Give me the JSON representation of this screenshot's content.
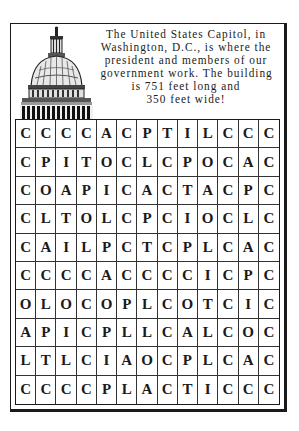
{
  "blurb": {
    "lines": [
      "The United States Capitol, in",
      "Washington, D.C., is where the",
      "president and members of our",
      "government work. The building",
      "is 751 feet long and",
      "350 feet wide!"
    ]
  },
  "illustration": {
    "icon": "capitol-dome-icon"
  },
  "puzzle": {
    "rows": [
      [
        "C",
        "C",
        "C",
        "C",
        "A",
        "C",
        "P",
        "T",
        "I",
        "L",
        "C",
        "C",
        "C"
      ],
      [
        "C",
        "P",
        "I",
        "T",
        "O",
        "C",
        "L",
        "C",
        "P",
        "O",
        "C",
        "A",
        "C"
      ],
      [
        "C",
        "O",
        "A",
        "P",
        "I",
        "C",
        "A",
        "C",
        "T",
        "A",
        "C",
        "P",
        "C"
      ],
      [
        "C",
        "L",
        "T",
        "O",
        "L",
        "C",
        "P",
        "C",
        "I",
        "O",
        "C",
        "L",
        "C"
      ],
      [
        "C",
        "A",
        "I",
        "L",
        "P",
        "C",
        "T",
        "C",
        "P",
        "L",
        "C",
        "A",
        "C"
      ],
      [
        "C",
        "C",
        "C",
        "C",
        "A",
        "C",
        "C",
        "C",
        "C",
        "I",
        "C",
        "P",
        "C"
      ],
      [
        "O",
        "L",
        "O",
        "C",
        "O",
        "P",
        "L",
        "C",
        "O",
        "T",
        "C",
        "I",
        "C"
      ],
      [
        "A",
        "P",
        "I",
        "C",
        "P",
        "L",
        "L",
        "C",
        "A",
        "L",
        "C",
        "O",
        "C"
      ],
      [
        "L",
        "T",
        "L",
        "C",
        "I",
        "A",
        "O",
        "C",
        "P",
        "L",
        "C",
        "A",
        "C"
      ],
      [
        "C",
        "C",
        "C",
        "C",
        "P",
        "L",
        "A",
        "C",
        "T",
        "I",
        "C",
        "C",
        "C"
      ]
    ]
  }
}
